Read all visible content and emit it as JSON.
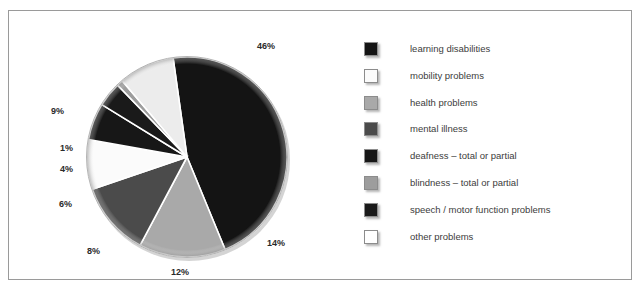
{
  "figure": {
    "background_color": "#ffffff",
    "frame_border_color": "#9a9a9a"
  },
  "chart_data": {
    "type": "pie",
    "title": "",
    "subtitle": "",
    "xlabel": "",
    "ylabel": "",
    "legend_position": "right",
    "grid": false,
    "units": "percent",
    "categories": [
      "learning disabilities",
      "mobility problems",
      "health problems",
      "mental illness",
      "deafness – total or partial",
      "blindness – total or partial",
      "speech / motor function problems",
      "other problems"
    ],
    "values": [
      46,
      8,
      14,
      12,
      6,
      1,
      4,
      9
    ],
    "colors": [
      "#141414",
      "#fbfbfb",
      "#a9a9a9",
      "#4b4b4b",
      "#171717",
      "#9d9d9d",
      "#1a1a1a",
      "#ececec"
    ],
    "data_labels": [
      "46%",
      "8%",
      "14%",
      "12%",
      "6%",
      "1%",
      "4%",
      "9%"
    ],
    "slice_order_clockwise_from_top": [
      {
        "label": "learning disabilities",
        "value": 46,
        "display": "46%",
        "color": "#141414"
      },
      {
        "label": "health problems",
        "value": 14,
        "display": "14%",
        "color": "#a9a9a9"
      },
      {
        "label": "mental illness",
        "value": 12,
        "display": "12%",
        "color": "#4b4b4b"
      },
      {
        "label": "mobility problems",
        "value": 8,
        "display": "8%",
        "color": "#fbfbfb"
      },
      {
        "label": "deafness – total or partial",
        "value": 6,
        "display": "6%",
        "color": "#171717"
      },
      {
        "label": "speech / motor function problems",
        "value": 4,
        "display": "4%",
        "color": "#1a1a1a"
      },
      {
        "label": "blindness – total or partial",
        "value": 1,
        "display": "1%",
        "color": "#9d9d9d"
      },
      {
        "label": "other problems",
        "value": 9,
        "display": "9%",
        "color": "#ececec"
      }
    ]
  },
  "pie_labels": {
    "l46": "46%",
    "l14": "14%",
    "l12": "12%",
    "l8": "8%",
    "l6": "6%",
    "l4": "4%",
    "l1": "1%",
    "l9": "9%"
  },
  "legend": {
    "items": [
      {
        "label": "learning disabilities",
        "color": "#141414"
      },
      {
        "label": "mobility problems",
        "color": "#fbfbfb"
      },
      {
        "label": "health problems",
        "color": "#a9a9a9"
      },
      {
        "label": "mental illness",
        "color": "#4b4b4b"
      },
      {
        "label": "deafness – total or partial",
        "color": "#171717"
      },
      {
        "label": "blindness – total or partial",
        "color": "#9d9d9d"
      },
      {
        "label": "speech / motor function problems",
        "color": "#1a1a1a"
      },
      {
        "label": "other problems",
        "color": "#ffffff"
      }
    ]
  }
}
